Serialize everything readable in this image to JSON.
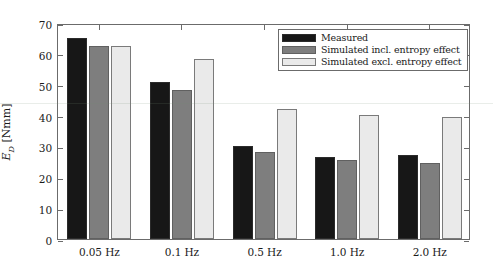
{
  "chart_data": {
    "type": "bar",
    "title": "",
    "xlabel": "",
    "ylabel": "E_D [Nmm]",
    "ylabel_parts": {
      "symbol": "E",
      "subscript": "D",
      "units": "[Nmm]"
    },
    "categories": [
      "0.05 Hz",
      "0.1 Hz",
      "0.5 Hz",
      "1.0 Hz",
      "2.0 Hz"
    ],
    "series": [
      {
        "name": "Measured",
        "color": "#171717",
        "values": [
          65.0,
          51.0,
          30.0,
          26.5,
          27.3
        ]
      },
      {
        "name": "Simulated incl. entropy effect",
        "color": "#7e7e7e",
        "values": [
          62.7,
          48.2,
          28.2,
          25.6,
          24.5
        ]
      },
      {
        "name": "Simulated excl. entropy effect",
        "color": "#eaeaea",
        "values": [
          62.5,
          58.4,
          42.0,
          40.2,
          39.6
        ]
      }
    ],
    "ylim": [
      0,
      70
    ],
    "yticks": [
      0,
      10,
      20,
      30,
      40,
      50,
      60,
      70
    ],
    "ytick_labels": [
      "0",
      "10",
      "20",
      "30",
      "40",
      "50",
      "60",
      "70"
    ],
    "grid": false,
    "legend_position": "top-right"
  },
  "legend": {
    "items": [
      {
        "label": "Measured",
        "swatch": "measured"
      },
      {
        "label": "Simulated incl. entropy effect",
        "swatch": "sim-incl"
      },
      {
        "label": "Simulated excl. entropy effect",
        "swatch": "sim-excl"
      }
    ]
  },
  "axes": {
    "y_symbol": "E",
    "y_subscript": "D",
    "y_units": "[Nmm]"
  }
}
